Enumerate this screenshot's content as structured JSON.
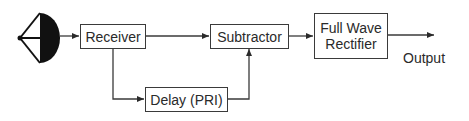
{
  "diagram": {
    "type": "block-diagram",
    "title": "",
    "nodes": [
      {
        "id": "antenna",
        "label": "",
        "icon": "antenna-dish-icon"
      },
      {
        "id": "receiver",
        "label": "Receiver"
      },
      {
        "id": "subtractor",
        "label": "Subtractor"
      },
      {
        "id": "rectifier",
        "label_line1": "Full Wave",
        "label_line2": "Rectifier"
      },
      {
        "id": "delay",
        "label": "Delay (PRI)"
      }
    ],
    "edges": [
      {
        "from": "antenna",
        "to": "receiver"
      },
      {
        "from": "receiver",
        "to": "subtractor"
      },
      {
        "from": "receiver",
        "to": "delay"
      },
      {
        "from": "delay",
        "to": "subtractor"
      },
      {
        "from": "subtractor",
        "to": "rectifier"
      },
      {
        "from": "rectifier",
        "to": "output"
      }
    ],
    "output_label": "Output",
    "colors": {
      "line": "#3a3a3a",
      "text": "#2a2a2a",
      "background": "#ffffff"
    }
  }
}
